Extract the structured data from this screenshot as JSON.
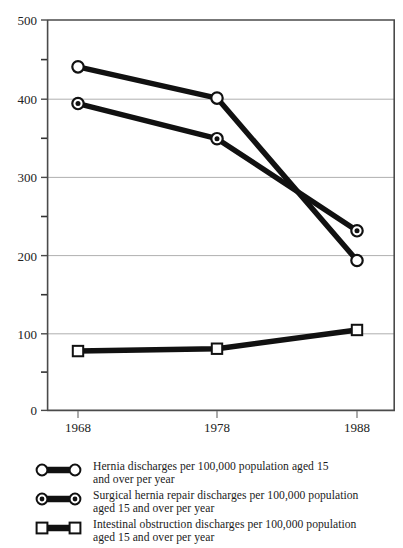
{
  "chart_data": {
    "type": "line",
    "title": "",
    "subtitle": "",
    "xlabel": "",
    "ylabel": "",
    "x": [
      1968,
      1978,
      1988
    ],
    "categories": [
      "1968",
      "1978",
      "1988"
    ],
    "xtick_labels": [
      "1968",
      "1978",
      "1988"
    ],
    "ytick_labels": [
      "0",
      "100",
      "200",
      "300",
      "400",
      "500"
    ],
    "ytick_values": [
      0,
      100,
      200,
      300,
      400,
      500
    ],
    "yminor_values": [
      50,
      150,
      250,
      350,
      450
    ],
    "ylim": [
      0,
      500
    ],
    "xlim": [
      1963,
      1993
    ],
    "grid": "horizontal-major",
    "legend_position": "below-plot",
    "marker_fill": "#ffffff",
    "line_color": "#111111",
    "grid_color": "#9a9a9a",
    "axis_color": "#555555",
    "series": [
      {
        "name": "Hernia discharges per 100,000 population aged 15 and over per year",
        "marker": "open-circle",
        "values": [
          440,
          400,
          192
        ]
      },
      {
        "name": "Surgical hernia repair discharges per 100,000 population aged 15 and over per year",
        "marker": "dot-circle",
        "values": [
          393,
          348,
          230
        ]
      },
      {
        "name": "Intestinal obstruction discharges per 100,000 population aged 15 and over per year",
        "marker": "open-square",
        "values": [
          76,
          79,
          103
        ]
      }
    ]
  },
  "legend": {
    "items": [
      {
        "marker": "open-circle",
        "line1": "Hernia discharges per 100,000 population aged 15",
        "line2": "and over per year"
      },
      {
        "marker": "dot-circle",
        "line1": "Surgical hernia repair discharges per 100,000 population",
        "line2": "aged 15 and over per year"
      },
      {
        "marker": "open-square",
        "line1": "Intestinal obstruction discharges per 100,000 population",
        "line2": "aged 15 and over per year"
      }
    ]
  },
  "axes": {
    "y": {
      "t500": "500",
      "t400": "400",
      "t300": "300",
      "t200": "200",
      "t100": "100",
      "t0": "0"
    },
    "x": {
      "t1968": "1968",
      "t1978": "1978",
      "t1988": "1988"
    }
  }
}
